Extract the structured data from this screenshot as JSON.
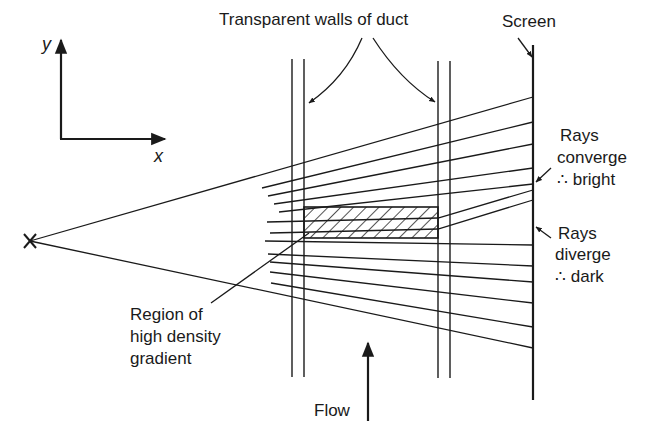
{
  "diagram": {
    "labels": {
      "axis_y": "y",
      "axis_x": "x",
      "walls": "Transparent walls of duct",
      "screen": "Screen",
      "converge_1": "Rays",
      "converge_2": "converge",
      "converge_3": "∴ bright",
      "diverge_1": "Rays",
      "diverge_2": "diverge",
      "diverge_3": "∴ dark",
      "region_1": "Region of",
      "region_2": "high density",
      "region_3": "gradient",
      "flow": "Flow"
    },
    "elements": {
      "source": "point light source (x mark)",
      "duct": "two pairs of vertical lines (transparent duct walls)",
      "hatched_region": "region of high density gradient",
      "screen": "vertical screen line",
      "rays_count": 14
    },
    "colors": {
      "ink": "#1a1a1a",
      "background": "#ffffff"
    }
  }
}
